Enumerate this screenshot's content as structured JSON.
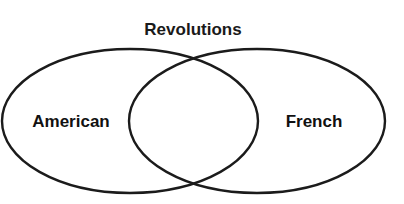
{
  "diagram": {
    "type": "venn",
    "title": "Revolutions",
    "background_color": "#ffffff",
    "stroke_color": "#1b1b1b",
    "text_color": "#111111",
    "stroke_width": 2.4,
    "title_position": {
      "x": 193,
      "y": 35
    },
    "sets": [
      {
        "id": "left",
        "label": "American",
        "label_x": 71,
        "label_y": 127,
        "cx": 130,
        "cy": 121,
        "rx": 128,
        "ry": 72
      },
      {
        "id": "right",
        "label": "French",
        "label_x": 314,
        "label_y": 127,
        "cx": 257,
        "cy": 121,
        "rx": 128,
        "ry": 72
      }
    ],
    "intersection": {
      "label": "",
      "top_crossing": {
        "x": 193,
        "y": 62
      },
      "bottom_crossing": {
        "x": 193,
        "y": 184
      }
    }
  }
}
